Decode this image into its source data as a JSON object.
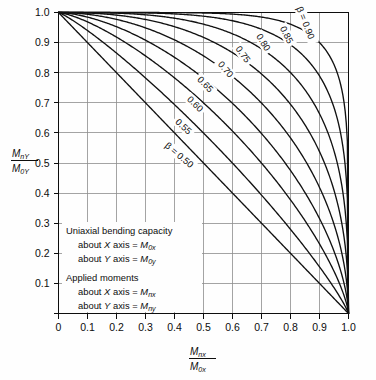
{
  "chart_data": {
    "type": "line",
    "title": "",
    "xlabel": "Mnx / M0x",
    "ylabel": "Mny / M0y",
    "xlim": [
      0,
      1.0
    ],
    "ylim": [
      0,
      1.0
    ],
    "grid": true,
    "legend_position": "inline-curve-labels",
    "x_ticks": [
      "0",
      "0.1",
      "0.2",
      "0.3",
      "0.4",
      "0.5",
      "0.6",
      "0.7",
      "0.8",
      "0.9",
      "1.0"
    ],
    "y_ticks": [
      "0.1",
      "0.2",
      "0.3",
      "0.4",
      "0.5",
      "0.6",
      "0.7",
      "0.8",
      "0.9",
      "1.0"
    ],
    "x_tick_values": [
      0,
      0.1,
      0.2,
      0.3,
      0.4,
      0.5,
      0.6,
      0.7,
      0.8,
      0.9,
      1.0
    ],
    "y_tick_values": [
      0.1,
      0.2,
      0.3,
      0.4,
      0.5,
      0.6,
      0.7,
      0.8,
      0.9,
      1.0
    ],
    "curve_equation": "(Mnx/M0x)^n + (Mny/M0y)^n = 1",
    "series": [
      {
        "name": "0.50",
        "beta": 0.5,
        "label": "β = 0.50",
        "exponent": 1.0,
        "label_pos": [
          0.415,
          0.525
        ],
        "label_rot": 40,
        "x": [
          0,
          0.1,
          0.2,
          0.3,
          0.4,
          0.5,
          0.6,
          0.7,
          0.8,
          0.9,
          1.0
        ],
        "y": [
          1.0,
          0.9,
          0.8,
          0.7,
          0.6,
          0.5,
          0.4,
          0.3,
          0.2,
          0.1,
          0.0
        ]
      },
      {
        "name": "0.55",
        "beta": 0.55,
        "label": "0.55",
        "exponent": 1.16,
        "label_pos": [
          0.43,
          0.62
        ],
        "label_rot": 42,
        "x": [
          0,
          0.1,
          0.2,
          0.3,
          0.4,
          0.5,
          0.6,
          0.7,
          0.8,
          0.9,
          1.0
        ],
        "y": [
          1.0,
          0.928,
          0.855,
          0.777,
          0.695,
          0.607,
          0.513,
          0.41,
          0.296,
          0.164,
          0.0
        ]
      },
      {
        "name": "0.60",
        "beta": 0.6,
        "label": "0.60",
        "exponent": 1.37,
        "label_pos": [
          0.47,
          0.695
        ],
        "label_rot": 44,
        "x": [
          0,
          0.1,
          0.2,
          0.3,
          0.4,
          0.5,
          0.6,
          0.7,
          0.8,
          0.9,
          1.0
        ],
        "y": [
          1.0,
          0.951,
          0.897,
          0.838,
          0.772,
          0.698,
          0.615,
          0.518,
          0.402,
          0.25,
          0.0
        ]
      },
      {
        "name": "0.65",
        "beta": 0.65,
        "label": "0.65",
        "exponent": 1.61,
        "label_pos": [
          0.505,
          0.76
        ],
        "label_rot": 46,
        "x": [
          0,
          0.1,
          0.2,
          0.3,
          0.4,
          0.5,
          0.6,
          0.7,
          0.8,
          0.9,
          1.0
        ],
        "y": [
          1.0,
          0.969,
          0.931,
          0.888,
          0.836,
          0.775,
          0.702,
          0.611,
          0.494,
          0.329,
          0.0
        ]
      },
      {
        "name": "0.70",
        "beta": 0.7,
        "label": "0.70",
        "exponent": 1.94,
        "label_pos": [
          0.575,
          0.81
        ],
        "label_rot": 50,
        "x": [
          0,
          0.1,
          0.2,
          0.3,
          0.4,
          0.5,
          0.6,
          0.7,
          0.8,
          0.9,
          1.0
        ],
        "y": [
          1.0,
          0.983,
          0.959,
          0.929,
          0.89,
          0.84,
          0.777,
          0.694,
          0.578,
          0.402,
          0.0
        ]
      },
      {
        "name": "0.75",
        "beta": 0.75,
        "label": "0.75",
        "exponent": 2.41,
        "label_pos": [
          0.635,
          0.86
        ],
        "label_rot": 54,
        "x": [
          0,
          0.1,
          0.2,
          0.3,
          0.4,
          0.5,
          0.6,
          0.7,
          0.8,
          0.9,
          1.0
        ],
        "y": [
          1.0,
          0.992,
          0.979,
          0.96,
          0.934,
          0.897,
          0.846,
          0.773,
          0.661,
          0.474,
          0.0
        ]
      },
      {
        "name": "0.80",
        "beta": 0.8,
        "label": "0.80",
        "exponent": 3.11,
        "label_pos": [
          0.705,
          0.9
        ],
        "label_rot": 58,
        "x": [
          0,
          0.1,
          0.2,
          0.3,
          0.4,
          0.5,
          0.6,
          0.7,
          0.8,
          0.9,
          1.0
        ],
        "y": [
          1.0,
          0.997,
          0.991,
          0.982,
          0.967,
          0.944,
          0.907,
          0.848,
          0.745,
          0.55,
          0.0
        ]
      },
      {
        "name": "0.85",
        "beta": 0.85,
        "label": "0.85",
        "exponent": 4.28,
        "label_pos": [
          0.785,
          0.925
        ],
        "label_rot": 63,
        "x": [
          0,
          0.1,
          0.2,
          0.3,
          0.4,
          0.5,
          0.6,
          0.7,
          0.8,
          0.9,
          1.0
        ],
        "y": [
          1.0,
          0.999,
          0.998,
          0.995,
          0.99,
          0.979,
          0.959,
          0.918,
          0.833,
          0.638,
          0.0
        ]
      },
      {
        "name": "0.90",
        "beta": 0.9,
        "label": "β = 0.90",
        "exponent": 6.58,
        "label_pos": [
          0.85,
          0.965
        ],
        "label_rot": 68,
        "x": [
          0,
          0.1,
          0.2,
          0.3,
          0.4,
          0.5,
          0.6,
          0.7,
          0.8,
          0.9,
          1.0
        ],
        "y": [
          1.0,
          1.0,
          1.0,
          0.999,
          0.999,
          0.997,
          0.991,
          0.976,
          0.927,
          0.752,
          0.0
        ]
      }
    ]
  },
  "y_axis_label": {
    "numerator_main": "M",
    "numerator_sub": "nY",
    "denominator_main": "M",
    "denominator_sub": "0Y"
  },
  "x_axis_label": {
    "numerator_main": "M",
    "numerator_sub": "nx",
    "denominator_main": "M",
    "denominator_sub": "0x"
  },
  "notes": {
    "line1": "Uniaxial bending capacity",
    "line2_pre": "about ",
    "line2_axis": "X",
    "line2_mid": " axis = ",
    "line2_sym": "M",
    "line2_sub": "0x",
    "line3_pre": "about ",
    "line3_axis": "Y",
    "line3_mid": " axis = ",
    "line3_sym": "M",
    "line3_sub": "0y",
    "line4": "Applied moments",
    "line5_pre": "about ",
    "line5_axis": "X",
    "line5_mid": " axis = ",
    "line5_sym": "M",
    "line5_sub": "nx",
    "line6_pre": "about ",
    "line6_axis": "Y",
    "line6_mid": " axis = ",
    "line6_sym": "M",
    "line6_sub": "ny"
  },
  "colors": {
    "curve": "#111111",
    "grid": "#8d8d8d",
    "frame": "#0d0d0d",
    "background": "#fefefe",
    "text": "#0d0d0d"
  }
}
